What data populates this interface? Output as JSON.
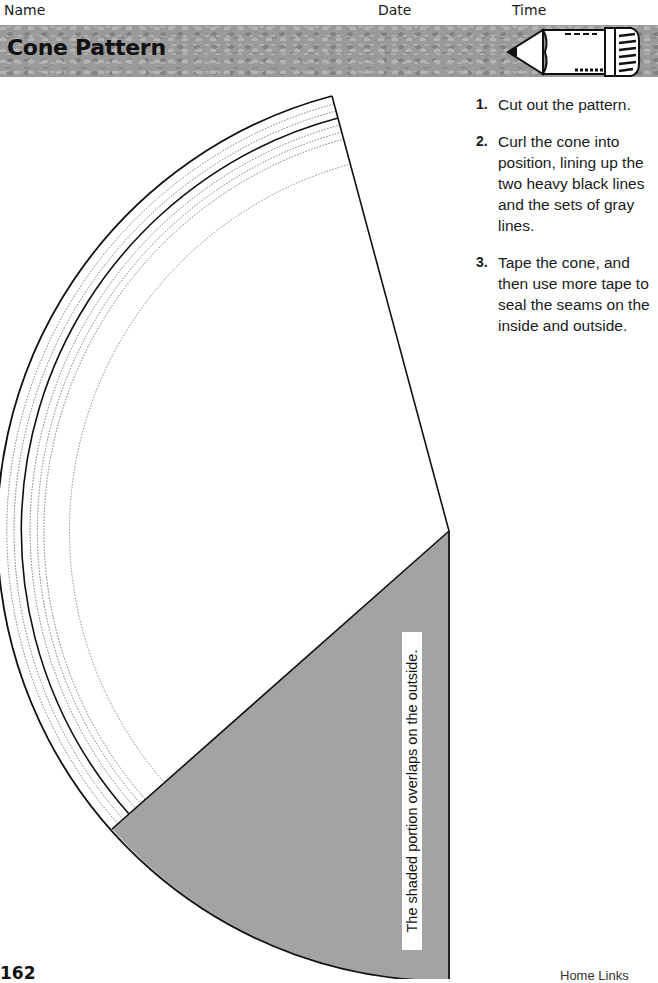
{
  "header": {
    "name_label": "Name",
    "date_label": "Date",
    "time_label": "Time",
    "title": "Cone Pattern",
    "ribbon_color": "#9a9a9a"
  },
  "instructions": [
    {
      "num": "1.",
      "text": "Cut out the pattern."
    },
    {
      "num": "2.",
      "text": "Curl the cone into position, lining up the two heavy black lines and the sets of gray lines."
    },
    {
      "num": "3.",
      "text": "Tape the cone, and then use more tape to seal the seams on the inside and outside."
    }
  ],
  "pattern": {
    "shaded_label": "The shaded portion overlaps on the outside.",
    "shaded_color": "#a3a3a3",
    "line_color": "#111111",
    "dotted_color": "#777777"
  },
  "footer": {
    "page_number": "162",
    "right_text": "Home Links"
  }
}
